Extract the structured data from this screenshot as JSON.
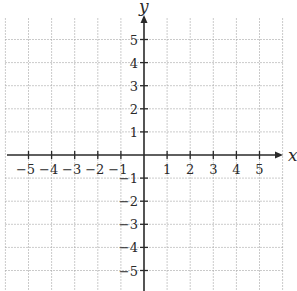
{
  "figure": {
    "type": "coordinate-plane",
    "axes": {
      "x": {
        "label": "x",
        "min": -5,
        "max": 5,
        "step": 1,
        "arrow": "positive"
      },
      "y": {
        "label": "y",
        "min": -5,
        "max": 5,
        "step": 1,
        "arrow": "positive"
      }
    },
    "x_tick_labels": [
      "−5",
      "−4",
      "−3",
      "−2",
      "−1",
      "1",
      "2",
      "3",
      "4",
      "5"
    ],
    "y_tick_labels": [
      "5",
      "4",
      "3",
      "2",
      "1",
      "−1",
      "−2",
      "−3",
      "−4",
      "−5"
    ],
    "grid": {
      "style": "dotted",
      "extent_units": [
        -6,
        6
      ]
    },
    "colors": {
      "axis": "#2a2a2a",
      "grid": "#a8a8a8",
      "background": "#ffffff"
    }
  },
  "chart_data": {
    "type": "scatter",
    "title": "",
    "xlabel": "x",
    "ylabel": "y",
    "xlim": [
      -6,
      6
    ],
    "ylim": [
      -6,
      6
    ],
    "x_ticks": [
      -5,
      -4,
      -3,
      -2,
      -1,
      1,
      2,
      3,
      4,
      5
    ],
    "y_ticks": [
      -5,
      -4,
      -3,
      -2,
      -1,
      1,
      2,
      3,
      4,
      5
    ],
    "grid": true,
    "series": []
  }
}
